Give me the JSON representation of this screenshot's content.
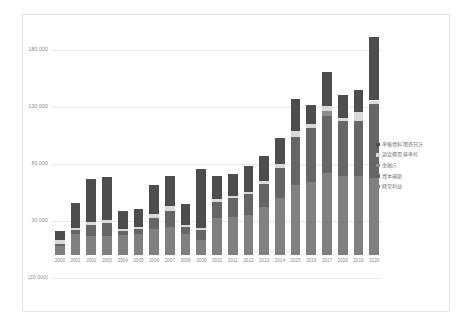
{
  "chart_data": {
    "type": "bar",
    "subtype": "stacked-column",
    "title": "",
    "xlabel": "",
    "ylabel": "",
    "grid": true,
    "legend_position": "right",
    "ylim": [
      -20000,
      205000
    ],
    "yticks": [
      180000,
      130000,
      80000,
      30000,
      -20000
    ],
    "ytick_labels": [
      "180,000",
      "130,000",
      "80,000",
      "30,000",
      "(20,000)"
    ],
    "categories": [
      "2000",
      "2001",
      "2002",
      "2003",
      "2004",
      "2005",
      "2006",
      "2007",
      "2008",
      "2009",
      "2010",
      "2011",
      "2012",
      "2013",
      "2014",
      "2015",
      "2016",
      "2017",
      "2018",
      "2019",
      "2020"
    ],
    "series": [
      {
        "name": "経常利益",
        "color": "#808080",
        "values": [
          8000,
          19000,
          17000,
          17000,
          18000,
          19000,
          23000,
          25000,
          19000,
          13000,
          33000,
          34000,
          35000,
          42000,
          50000,
          62000,
          64000,
          72000,
          70000,
          70000,
          68000
        ]
      },
      {
        "name": "資本補助",
        "color": "#666666",
        "values": [
          2000,
          3000,
          10000,
          11000,
          3000,
          4000,
          10000,
          14000,
          6000,
          9000,
          14000,
          16000,
          19000,
          21000,
          27000,
          42000,
          48000,
          50000,
          48000,
          48000,
          65000
        ]
      },
      {
        "name": "金融庁",
        "color": "#8c8c8c",
        "values": [
          0,
          0,
          0,
          0,
          0,
          0,
          0,
          0,
          0,
          0,
          0,
          0,
          0,
          0,
          0,
          0,
          0,
          5000,
          0,
          0,
          0
        ]
      },
      {
        "name": "調査費用基準枠",
        "color": "#d9d9d9",
        "values": [
          3000,
          2000,
          2000,
          3000,
          2000,
          2000,
          3000,
          4000,
          2000,
          2000,
          2000,
          2000,
          2000,
          2000,
          3000,
          5000,
          3000,
          4000,
          3000,
          8000,
          3000
        ]
      },
      {
        "name": "準備資料関係日計",
        "color": "#4d4d4d",
        "values": [
          8000,
          22000,
          38000,
          38000,
          16000,
          16000,
          26000,
          27000,
          18000,
          52000,
          21000,
          19000,
          22000,
          22000,
          23000,
          28000,
          17000,
          30000,
          20000,
          19000,
          56000
        ]
      }
    ],
    "totals": [
      21000,
      46000,
      67000,
      69000,
      39000,
      41000,
      62000,
      70000,
      45000,
      76000,
      70000,
      71000,
      78000,
      87000,
      103000,
      137000,
      132000,
      161000,
      141000,
      145000,
      192000
    ]
  },
  "legend": {
    "items": [
      {
        "label": "準備資料関係日計",
        "color": "#4d4d4d"
      },
      {
        "label": "調査費用基準枠",
        "color": "#d9d9d9"
      },
      {
        "label": "金融庁",
        "color": "#8c8c8c"
      },
      {
        "label": "資本補助",
        "color": "#666666"
      },
      {
        "label": "経常利益",
        "color": "#808080"
      }
    ]
  },
  "colors": {
    "gridline": "#e8e8e8",
    "frame": "#e3e3e3",
    "axis_text": "#8a8a8a",
    "legend_text": "#777777",
    "background": "#ffffff"
  }
}
